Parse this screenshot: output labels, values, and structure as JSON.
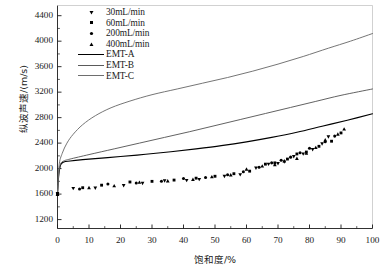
{
  "chart_data": {
    "type": "scatter",
    "title": "",
    "xlabel": "饱和度/%",
    "ylabel": "纵波声速/(m/s)",
    "xlim": [
      0,
      100
    ],
    "ylim": [
      1060,
      4560
    ],
    "xticks": [
      0,
      10,
      20,
      30,
      40,
      50,
      60,
      70,
      80,
      90,
      100
    ],
    "yticks": [
      1200,
      1600,
      2000,
      2400,
      2800,
      3200,
      3600,
      4000,
      4400
    ],
    "grid": false,
    "legend_position": "top-left",
    "legend": [
      {
        "label": "30mL/min",
        "marker": "triangle-down",
        "kind": "marker",
        "color": "#000000"
      },
      {
        "label": "60mL/min",
        "marker": "square",
        "kind": "marker",
        "color": "#000000"
      },
      {
        "label": "200mL/min",
        "marker": "circle",
        "kind": "marker",
        "color": "#000000"
      },
      {
        "label": "400mL/min",
        "marker": "triangle-up",
        "kind": "marker",
        "color": "#000000"
      },
      {
        "label": "EMT-A",
        "kind": "line",
        "color": "#000000"
      },
      {
        "label": "EMT-B",
        "kind": "line",
        "color": "#5a5a5a"
      },
      {
        "label": "EMT-C",
        "kind": "line",
        "color": "#6e6e6e"
      }
    ],
    "series": [
      {
        "name": "30mL/min",
        "marker": "triangle-down",
        "points": [
          [
            0,
            1610
          ],
          [
            5,
            1690
          ],
          [
            12,
            1695
          ],
          [
            21,
            1735
          ],
          [
            27,
            1770
          ],
          [
            34,
            1810
          ],
          [
            41,
            1815
          ],
          [
            45,
            1830
          ],
          [
            53,
            1880
          ],
          [
            58,
            1905
          ],
          [
            63,
            2010
          ],
          [
            67,
            2070
          ],
          [
            70,
            2080
          ],
          [
            72,
            2105
          ],
          [
            75,
            2190
          ],
          [
            78,
            2230
          ],
          [
            81,
            2300
          ],
          [
            84,
            2390
          ],
          [
            86,
            2500
          ]
        ]
      },
      {
        "name": "60mL/min",
        "marker": "square",
        "points": [
          [
            0,
            1600
          ],
          [
            8,
            1700
          ],
          [
            14,
            1740
          ],
          [
            23,
            1790
          ],
          [
            30,
            1800
          ],
          [
            37,
            1820
          ],
          [
            44,
            1850
          ],
          [
            50,
            1880
          ],
          [
            56,
            1920
          ],
          [
            61,
            1960
          ],
          [
            66,
            2070
          ],
          [
            69,
            2090
          ],
          [
            73,
            2150
          ],
          [
            76,
            2230
          ],
          [
            79,
            2260
          ],
          [
            83,
            2350
          ],
          [
            87,
            2430
          ],
          [
            90,
            2560
          ]
        ]
      },
      {
        "name": "200mL/min",
        "marker": "circle",
        "points": [
          [
            0,
            1605
          ],
          [
            7,
            1680
          ],
          [
            16,
            1760
          ],
          [
            25,
            1775
          ],
          [
            33,
            1800
          ],
          [
            40,
            1845
          ],
          [
            47,
            1860
          ],
          [
            54,
            1905
          ],
          [
            59,
            1950
          ],
          [
            64,
            2020
          ],
          [
            68,
            2090
          ],
          [
            71,
            2130
          ],
          [
            74,
            2180
          ],
          [
            77,
            2250
          ],
          [
            80,
            2320
          ],
          [
            85,
            2420
          ],
          [
            88,
            2510
          ]
        ]
      },
      {
        "name": "400mL/min",
        "marker": "triangle-up",
        "points": [
          [
            0,
            1595
          ],
          [
            10,
            1700
          ],
          [
            18,
            1730
          ],
          [
            26,
            1785
          ],
          [
            35,
            1805
          ],
          [
            43,
            1830
          ],
          [
            49,
            1870
          ],
          [
            55,
            1900
          ],
          [
            60,
            1990
          ],
          [
            65,
            2040
          ],
          [
            69,
            2060
          ],
          [
            72,
            2120
          ],
          [
            76,
            2160
          ],
          [
            79,
            2240
          ],
          [
            82,
            2330
          ],
          [
            85,
            2450
          ],
          [
            89,
            2540
          ],
          [
            91,
            2620
          ]
        ]
      }
    ],
    "curves": [
      {
        "name": "EMT-A",
        "color": "#000000",
        "points": [
          [
            0,
            1600
          ],
          [
            0.4,
            1900
          ],
          [
            1,
            2060
          ],
          [
            2,
            2105
          ],
          [
            4,
            2120
          ],
          [
            8,
            2140
          ],
          [
            14,
            2165
          ],
          [
            20,
            2190
          ],
          [
            28,
            2225
          ],
          [
            36,
            2265
          ],
          [
            44,
            2310
          ],
          [
            52,
            2360
          ],
          [
            60,
            2420
          ],
          [
            68,
            2490
          ],
          [
            76,
            2570
          ],
          [
            84,
            2665
          ],
          [
            92,
            2760
          ],
          [
            100,
            2860
          ]
        ]
      },
      {
        "name": "EMT-B",
        "color": "#5a5a5a",
        "points": [
          [
            0,
            1600
          ],
          [
            0.4,
            1920
          ],
          [
            1,
            2075
          ],
          [
            2,
            2120
          ],
          [
            4,
            2150
          ],
          [
            10,
            2220
          ],
          [
            18,
            2310
          ],
          [
            26,
            2400
          ],
          [
            34,
            2490
          ],
          [
            42,
            2580
          ],
          [
            50,
            2675
          ],
          [
            58,
            2770
          ],
          [
            66,
            2865
          ],
          [
            74,
            2960
          ],
          [
            82,
            3055
          ],
          [
            90,
            3150
          ],
          [
            100,
            3250
          ]
        ]
      },
      {
        "name": "EMT-C",
        "color": "#6e6e6e",
        "points": [
          [
            0,
            1600
          ],
          [
            0.5,
            2050
          ],
          [
            1.5,
            2240
          ],
          [
            3,
            2400
          ],
          [
            5,
            2540
          ],
          [
            8,
            2690
          ],
          [
            12,
            2830
          ],
          [
            17,
            2955
          ],
          [
            23,
            3060
          ],
          [
            30,
            3160
          ],
          [
            38,
            3250
          ],
          [
            46,
            3340
          ],
          [
            54,
            3430
          ],
          [
            62,
            3530
          ],
          [
            70,
            3640
          ],
          [
            78,
            3760
          ],
          [
            86,
            3890
          ],
          [
            93,
            4000
          ],
          [
            100,
            4120
          ]
        ]
      }
    ]
  }
}
